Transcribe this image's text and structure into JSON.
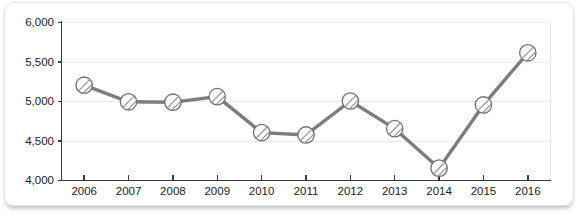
{
  "chart_data": {
    "type": "line",
    "title": "",
    "subtitle": "",
    "xlabel": "",
    "ylabel": "",
    "categories": [
      "2006",
      "2007",
      "2008",
      "2009",
      "2010",
      "2011",
      "2012",
      "2013",
      "2014",
      "2015",
      "2016"
    ],
    "values": [
      5200,
      4990,
      4985,
      5055,
      4600,
      4570,
      5000,
      4650,
      4150,
      4950,
      5610
    ],
    "series": [
      {
        "name": "series-1",
        "values": [
          5200,
          4990,
          4985,
          5055,
          4600,
          4570,
          5000,
          4650,
          4150,
          4950,
          5610
        ]
      }
    ],
    "ylim": [
      4000,
      6000
    ],
    "yticks": [
      4000,
      4500,
      5000,
      5500,
      6000
    ],
    "ytick_labels": [
      "4,000",
      "4,500",
      "5,000",
      "5,500",
      "6,000"
    ],
    "xtick_labels": [
      "2006",
      "2007",
      "2008",
      "2009",
      "2010",
      "2011",
      "2012",
      "2013",
      "2014",
      "2015",
      "2016"
    ],
    "grid": true,
    "legend": false,
    "legend_position": "none",
    "marker": "hatched-circle",
    "colors": {
      "line": "#7d7d7d",
      "marker_fill": "#fbfbfb",
      "marker_stroke": "#6e6e6e",
      "grid": "#ebebeb",
      "axis": "#3a3a3a",
      "text": "#1a1a1a",
      "card_background": "#ffffff",
      "card_border": "#e2e2e2"
    }
  }
}
